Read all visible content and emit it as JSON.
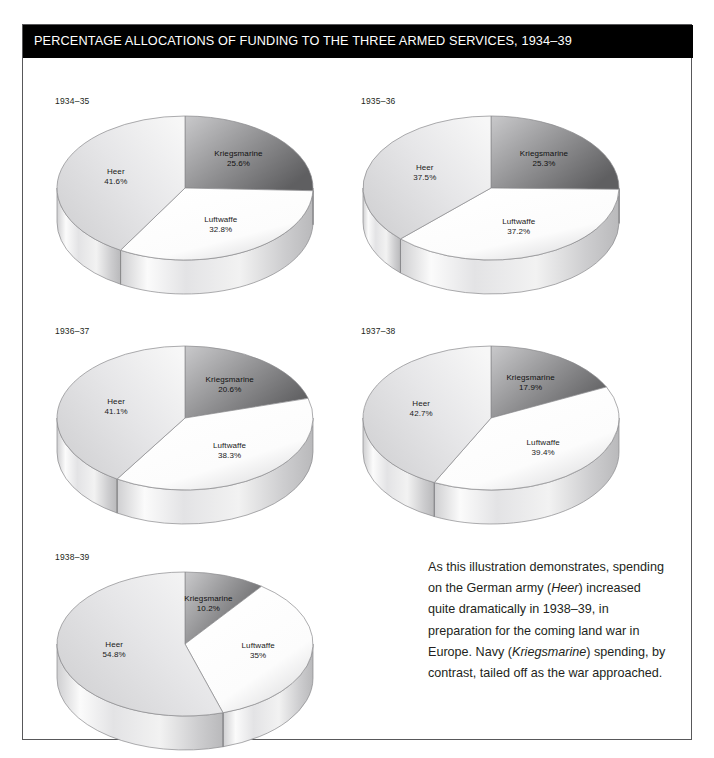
{
  "header": {
    "title": "PERCENTAGE ALLOCATIONS OF FUNDING TO THE THREE ARMED SERVICES, 1934–39"
  },
  "colors": {
    "title_bar": "#000000",
    "title_text": "#ffffff",
    "frame_border": "#58585a",
    "background": "#ffffff",
    "kriegsmarine_dark": "#6e6e70",
    "kriegsmarine_light": "#c9c9cb",
    "heer_light": "#f4f4f4",
    "heer_mid": "#d3d3d5",
    "luftwaffe_light": "#fcfcfc",
    "luftwaffe_mid": "#dedede",
    "slice_outline": "#8a8a8c",
    "label_text": "#1a1a1a"
  },
  "chart_data": {
    "type": "pie",
    "title": "PERCENTAGE ALLOCATIONS OF FUNDING TO THE THREE ARMED SERVICES, 1934–39",
    "unit": "percent",
    "series_names": [
      "Kriegsmarine",
      "Luftwaffe",
      "Heer"
    ],
    "legend_position": "in-slice labels",
    "charts": [
      {
        "year": "1934–35",
        "slices": [
          {
            "label": "Kriegsmarine",
            "value": 25.6,
            "value_text": "25.6%"
          },
          {
            "label": "Luftwaffe",
            "value": 32.8,
            "value_text": "32.8%"
          },
          {
            "label": "Heer",
            "value": 41.6,
            "value_text": "41.6%"
          }
        ]
      },
      {
        "year": "1935–36",
        "slices": [
          {
            "label": "Kriegsmarine",
            "value": 25.3,
            "value_text": "25.3%"
          },
          {
            "label": "Luftwaffe",
            "value": 37.2,
            "value_text": "37.2%"
          },
          {
            "label": "Heer",
            "value": 37.5,
            "value_text": "37.5%"
          }
        ]
      },
      {
        "year": "1936–37",
        "slices": [
          {
            "label": "Kriegsmarine",
            "value": 20.6,
            "value_text": "20.6%"
          },
          {
            "label": "Luftwaffe",
            "value": 38.3,
            "value_text": "38.3%"
          },
          {
            "label": "Heer",
            "value": 41.1,
            "value_text": "41.1%"
          }
        ]
      },
      {
        "year": "1937–38",
        "slices": [
          {
            "label": "Kriegsmarine",
            "value": 17.9,
            "value_text": "17.9%"
          },
          {
            "label": "Luftwaffe",
            "value": 39.4,
            "value_text": "39.4%"
          },
          {
            "label": "Heer",
            "value": 42.7,
            "value_text": "42.7%"
          }
        ]
      },
      {
        "year": "1938–39",
        "slices": [
          {
            "label": "Kriegsmarine",
            "value": 10.2,
            "value_text": "10.2%"
          },
          {
            "label": "Luftwaffe",
            "value": 35.0,
            "value_text": "35%"
          },
          {
            "label": "Heer",
            "value": 54.8,
            "value_text": "54.8%"
          }
        ]
      }
    ]
  },
  "caption": {
    "line1": "As this illustration demonstrates,",
    "line2_a": "spending on the German army (",
    "line2_em": "Heer",
    "line2_b": ")",
    "line3": "increased quite dramatically in 1938–39,",
    "line4": "in preparation for the coming land",
    "line5_a": "war in Europe. Navy (",
    "line5_em": "Kriegsmarine",
    "line5_b": ")",
    "line6": "spending, by contrast, tailed off as the",
    "line7": "war approached."
  }
}
